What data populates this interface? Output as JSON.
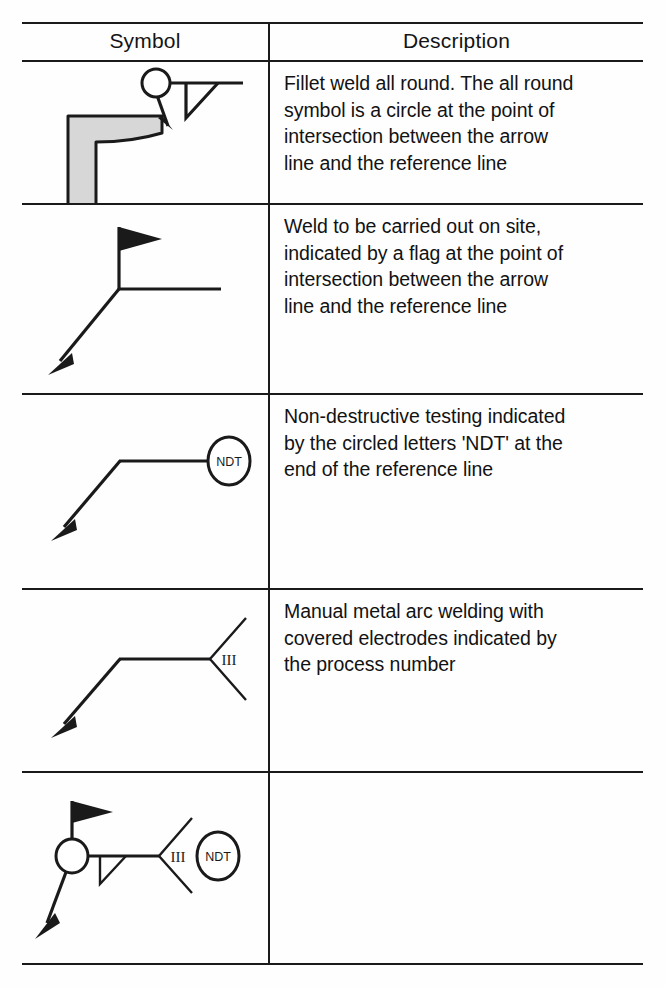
{
  "document": {
    "type": "welding-symbol-reference-table",
    "background_color": "#fefefe",
    "line_color": "#1a1a1a",
    "plate_fill_color": "#d7d7d7"
  },
  "table": {
    "columns": [
      {
        "key": "symbol",
        "header": "Symbol"
      },
      {
        "key": "description",
        "header": "Description"
      }
    ],
    "rows": [
      {
        "symbol_name": "fillet-weld-all-round-symbol",
        "symbol_elements": [
          "l-bracket-plate",
          "arrow-line",
          "all-round-circle",
          "reference-line",
          "fillet-triangle"
        ],
        "description": "Fillet weld all round. The all round\nsymbol is a circle at the point of\nintersection between the arrow\nline and the reference line"
      },
      {
        "symbol_name": "site-weld-flag-symbol",
        "symbol_elements": [
          "arrow-line",
          "site-flag",
          "reference-line"
        ],
        "description": "Weld to be carried out on site,\nindicated by a flag at the point of\nintersection between the arrow\nline and the reference line"
      },
      {
        "symbol_name": "ndt-circle-symbol",
        "symbol_elements": [
          "arrow-line",
          "reference-line",
          "ndt-circle"
        ],
        "symbol_text": "NDT",
        "description": "Non-destructive testing indicated\nby the circled letters 'NDT' at the\nend of the reference line"
      },
      {
        "symbol_name": "process-number-tail-symbol",
        "symbol_elements": [
          "arrow-line",
          "reference-line",
          "tail-fork",
          "process-number"
        ],
        "symbol_text": "III",
        "description": "Manual metal arc welding with\ncovered electrodes indicated by\nthe process number"
      },
      {
        "symbol_name": "combined-welding-symbol",
        "symbol_elements": [
          "arrow-line",
          "site-flag",
          "all-round-circle",
          "reference-line",
          "fillet-triangle",
          "tail-fork",
          "process-number",
          "ndt-circle"
        ],
        "symbol_text_process": "III",
        "symbol_text_ndt": "NDT",
        "description": ""
      }
    ]
  }
}
